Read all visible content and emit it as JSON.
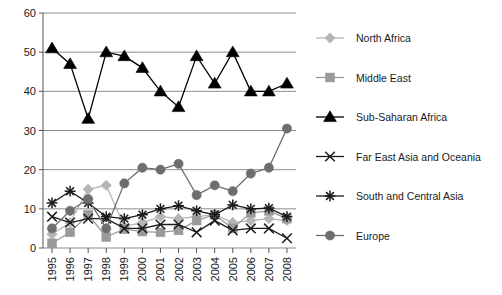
{
  "chart_data": {
    "type": "line",
    "title": "",
    "xlabel": "",
    "ylabel": "",
    "categories": [
      "1995",
      "1996",
      "1997",
      "1998",
      "1999",
      "2000",
      "2001",
      "2002",
      "2003",
      "2004",
      "2005",
      "2006",
      "2007",
      "2008"
    ],
    "ylim": [
      0,
      60
    ],
    "ytick_step": 10,
    "yticks": [
      "0",
      "10",
      "20",
      "30",
      "40",
      "50",
      "60"
    ],
    "grid": "horizontal",
    "legend_position": "right",
    "series": [
      {
        "name": "North Africa",
        "marker": "diamond",
        "color": "#b5b5b5",
        "values": [
          3.5,
          6.5,
          15.0,
          16.0,
          5.5,
          6.5,
          8.0,
          7.5,
          8.0,
          8.5,
          6.5,
          7.0,
          7.5,
          7.0
        ]
      },
      {
        "name": "Middle East",
        "marker": "square",
        "color": "#9a9a9a",
        "values": [
          1.2,
          4.0,
          8.5,
          2.8,
          4.8,
          4.2,
          4.0,
          4.5,
          7.0,
          8.5,
          5.0,
          9.0,
          9.5,
          7.5
        ]
      },
      {
        "name": "Sub-Saharan Africa",
        "marker": "triangle",
        "color": "#000000",
        "values": [
          51.0,
          47.0,
          33.0,
          50.0,
          49.0,
          46.0,
          40.0,
          36.0,
          49.0,
          42.0,
          50.0,
          40.0,
          40.0,
          42.0
        ]
      },
      {
        "name": "Far East Asia and Oceania",
        "marker": "cross",
        "color": "#1a1a1a",
        "values": [
          8.0,
          6.5,
          7.5,
          7.5,
          5.0,
          5.0,
          6.0,
          6.0,
          4.0,
          7.0,
          4.5,
          5.0,
          5.0,
          2.5
        ]
      },
      {
        "name": "South and Central Asia",
        "marker": "asterisk",
        "color": "#1a1a1a",
        "values": [
          11.5,
          14.5,
          11.5,
          8.0,
          7.5,
          8.5,
          10.0,
          10.8,
          9.5,
          8.5,
          11.0,
          10.0,
          10.2,
          8.0
        ]
      },
      {
        "name": "Europe",
        "marker": "circle",
        "color": "#6e6e6e",
        "values": [
          5.0,
          9.5,
          12.5,
          5.0,
          16.5,
          20.5,
          20.0,
          21.5,
          13.5,
          16.0,
          14.5,
          19.0,
          20.5,
          30.5
        ]
      }
    ]
  },
  "legend": {
    "items": [
      {
        "label": "North Africa"
      },
      {
        "label": "Middle East"
      },
      {
        "label": "Sub-Saharan Africa"
      },
      {
        "label": "Far East Asia and Oceania"
      },
      {
        "label": "South and Central Asia"
      },
      {
        "label": "Europe"
      }
    ]
  }
}
